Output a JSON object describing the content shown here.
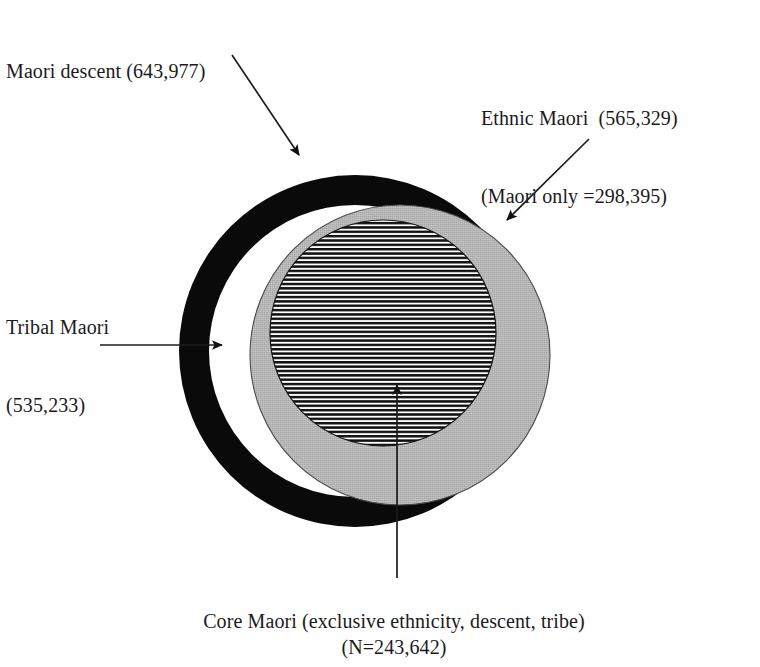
{
  "figure": {
    "type": "venn-diagram",
    "title_text": "Maori descent (643,977)",
    "background_color": "#ffffff"
  },
  "labels": {
    "descent": "Maori descent (643,977)",
    "ethnic_line1": "Ethnic Maori  (565,329)",
    "ethnic_line2": "(Maori only =298,395)",
    "tribal_line1": "Tribal Maori",
    "tribal_line2": "(535,233)",
    "core_line1": "Core Maori (exclusive ethnicity, descent, tribe)",
    "core_line2": "(N=243,642)"
  },
  "sets": [
    {
      "name": "Maori descent",
      "value": 643977,
      "value_text": "643,977",
      "fill_style": "black-ring",
      "color": "#000000",
      "label_position": "top-left",
      "geometry": {
        "cx": 355,
        "cy": 351,
        "r": 176,
        "ring_thickness": 30
      }
    },
    {
      "name": "Ethnic Maori",
      "value": 565329,
      "value_text": "565,329",
      "sub_label": "Maori only",
      "sub_value": 298395,
      "sub_value_text": "298,395",
      "fill_style": "solid-gray",
      "color": "#b4b4b4",
      "label_position": "top-right",
      "geometry": {
        "cx": 400,
        "cy": 355,
        "r": 150
      }
    },
    {
      "name": "Tribal Maori",
      "value": 535233,
      "value_text": "535,233",
      "fill_style": "none",
      "color": "#000000",
      "label_position": "left",
      "geometry": {
        "cx": 355,
        "cy": 351,
        "r": 146
      }
    },
    {
      "name": "Core Maori",
      "description": "exclusive ethnicity, descent, tribe",
      "value": 243642,
      "value_text": "N=243,642",
      "fill_style": "horizontal-stripes",
      "color": "#000000",
      "label_position": "bottom",
      "geometry": {
        "cx": 383,
        "cy": 333,
        "r": 113
      }
    }
  ],
  "annotations": [
    {
      "name": "descent-arrow",
      "icon": "arrow-down-right-icon",
      "from": [
        232,
        55
      ],
      "to": [
        301,
        158
      ]
    },
    {
      "name": "ethnic-arrow",
      "icon": "arrow-down-left-icon",
      "from": [
        589,
        139
      ],
      "to": [
        504,
        223
      ]
    },
    {
      "name": "tribal-arrow",
      "icon": "arrow-right-icon",
      "from": [
        100,
        345
      ],
      "to": [
        226,
        345
      ]
    },
    {
      "name": "core-arrow",
      "icon": "arrow-up-icon",
      "from": [
        397,
        578
      ],
      "to": [
        397,
        379
      ]
    }
  ]
}
